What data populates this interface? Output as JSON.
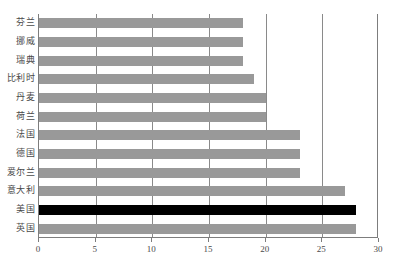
{
  "chart_data": {
    "type": "bar",
    "orientation": "horizontal",
    "title": "",
    "xlabel": "",
    "ylabel": "",
    "xlim": [
      0,
      30
    ],
    "ylim": null,
    "grid": true,
    "legend": null,
    "xticks": [
      "0",
      "5",
      "10",
      "15",
      "20",
      "25",
      "30"
    ],
    "xtick_values": [
      0,
      5,
      10,
      15,
      20,
      25,
      30
    ],
    "categories": [
      "芬兰",
      "挪威",
      "瑞典",
      "比利时",
      "丹麦",
      "荷兰",
      "法国",
      "德国",
      "爱尔兰",
      "意大利",
      "美国",
      "英国"
    ],
    "values": [
      18,
      18,
      18,
      19,
      20,
      20,
      23,
      23,
      23,
      27,
      28,
      28
    ],
    "highlight_index": 10,
    "colors": {
      "bar": "#999999",
      "highlight_bar": "#000000",
      "gridline": "#8a8a8a",
      "axis": "#7d7d7d",
      "text": "#4a4a4a",
      "background": "#ffffff"
    }
  }
}
